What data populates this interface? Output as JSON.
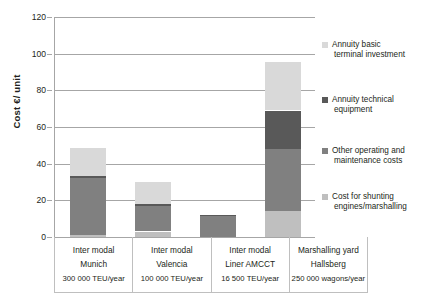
{
  "chart_data": {
    "type": "bar",
    "stacked": true,
    "title": "",
    "xlabel": "",
    "ylabel": "Cost €/ unit",
    "ylim": [
      0,
      120
    ],
    "yticks": [
      0,
      20,
      40,
      60,
      80,
      100,
      120
    ],
    "grid": true,
    "legend_position": "right",
    "categories": [
      "Inter modal Munich 300 000 TEU/year",
      "Inter modal Valencia 100 000 TEU/year",
      "Inter modal Liner AMCCT 16 500 TEU/year",
      "Marshalling yard Hallsberg 250 000 wagons/year"
    ],
    "category_lines": [
      [
        "Inter modal",
        "Munich",
        "300 000 TEU/year"
      ],
      [
        "Inter modal",
        "Valencia",
        "100 000 TEU/year"
      ],
      [
        "Inter modal",
        "Liner AMCCT",
        "16 500 TEU/year"
      ],
      [
        "Marshalling yard",
        "Hallsberg",
        "250 000 wagons/year"
      ]
    ],
    "series": [
      {
        "name": "Cost for shunting engines/marshalling",
        "color": "#bfbfbf",
        "values": [
          1.0,
          3.0,
          0.0,
          14.0
        ]
      },
      {
        "name": "Other operating and maintenance costs",
        "color": "#808080",
        "values": [
          31.0,
          14.0,
          11.5,
          34.0
        ]
      },
      {
        "name": "Annuity technical equipment",
        "color": "#595959",
        "values": [
          1.5,
          1.0,
          0.5,
          21.0
        ]
      },
      {
        "name": "Annuity basic terminal investment",
        "color": "#d9d9d9",
        "values": [
          15.0,
          12.0,
          0.0,
          26.5
        ]
      }
    ],
    "totals": [
      48.5,
      30.0,
      12.0,
      95.5
    ]
  },
  "legend": {
    "items": [
      {
        "label_line1": "Annuity basic",
        "label_line2": "terminal investment",
        "color": "#d9d9d9"
      },
      {
        "label_line1": "Annuity technical",
        "label_line2": "equipment",
        "color": "#595959"
      },
      {
        "label_line1": "Other operating and",
        "label_line2": "maintenance costs",
        "color": "#808080"
      },
      {
        "label_line1": "Cost for shunting",
        "label_line2": "engines/marshalling",
        "color": "#bfbfbf"
      }
    ]
  },
  "axis": {
    "y_title": "Cost €/ unit",
    "y_tick_labels": [
      "120",
      "100",
      "80",
      "60",
      "40",
      "20",
      "0"
    ]
  }
}
